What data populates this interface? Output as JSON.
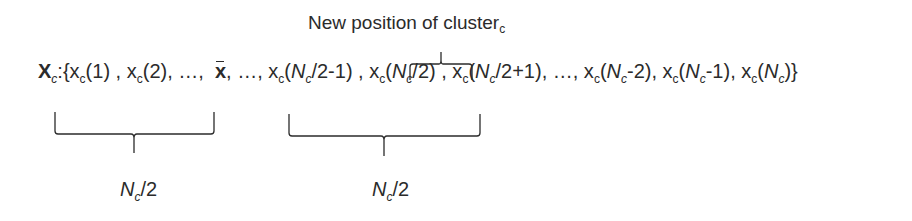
{
  "title": {
    "text": "New position of cluster",
    "subscript": "c"
  },
  "equation": {
    "set_symbol": "X",
    "set_subscript": "c",
    "terms": [
      "x_c(1)",
      "x_c(2)",
      "...",
      "x̄",
      "...",
      "x_c(N_c/2-1)",
      "x_c(N_c/2)",
      "x_c(N_c/2+1)",
      "...",
      "x_c(N_c-2)",
      "x_c(N_c-1)",
      "x_c(N_c)"
    ]
  },
  "braces": {
    "top": {
      "label_ref": "title",
      "spans": "x_c(N_c/2)"
    },
    "bottom_left": {
      "label": "N_c/2",
      "spans": "x_c(1) … x_c(N_c/2-1)"
    },
    "bottom_right": {
      "label": "N_c/2",
      "spans": "x_c(N_c/2+1) … x_c(N_c)"
    }
  },
  "labels": {
    "left_n": "N",
    "left_sub": "c",
    "left_rest": "/2",
    "right_n": "N",
    "right_sub": "c",
    "right_rest": "/2"
  },
  "colors": {
    "ink": "#2b2b2b",
    "background": "#ffffff"
  }
}
